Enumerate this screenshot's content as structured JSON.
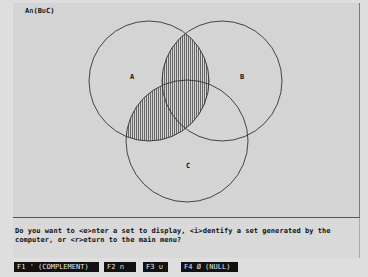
{
  "display": {
    "title": "A∩(B∪C)",
    "venn": {
      "circles": [
        {
          "label": "A",
          "cx": 149,
          "cy": 81,
          "r": 60,
          "label_x": 132,
          "label_y": 77
        },
        {
          "label": "B",
          "cx": 222,
          "cy": 81,
          "r": 60,
          "label_x": 240,
          "label_y": 77
        },
        {
          "label": "C",
          "cx": 187,
          "cy": 141,
          "r": 61,
          "label_x": 186,
          "label_y": 165
        }
      ],
      "shaded_region": "A∩(B∪C)",
      "shading_style": "vertical-hatch",
      "line_color": "#333333",
      "hatch_color": "#555555"
    }
  },
  "prompt": {
    "line1": "Do you want to <e>nter a set to display, <i>dentify a set generated by the",
    "line2": "computer, or <r>eturn to the main menu?"
  },
  "function_keys": [
    {
      "key": "F1",
      "label": "F1 ' (COMPLEMENT)"
    },
    {
      "key": "F2",
      "label": "F2 ∩"
    },
    {
      "key": "F3",
      "label": "F3 ∪"
    },
    {
      "key": "F4",
      "label": "F4 Ø (NULL)"
    }
  ]
}
